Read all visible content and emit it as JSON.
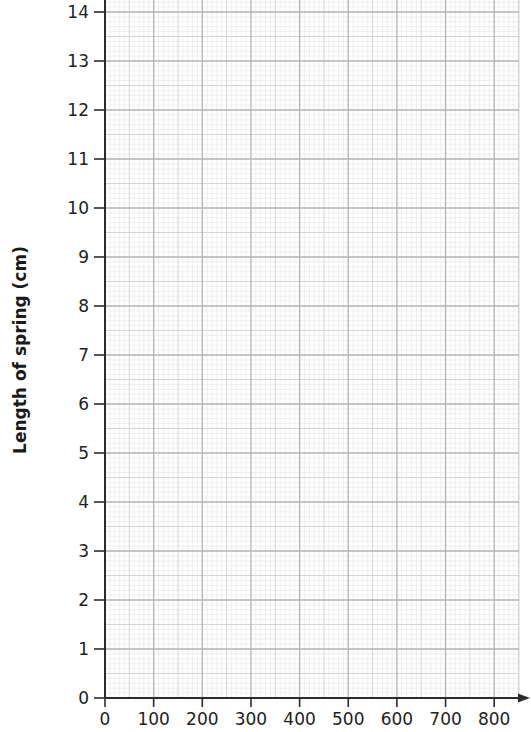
{
  "chart_data": {
    "type": "line",
    "title": "",
    "xlabel": "",
    "ylabel": "Length of spring (cm)",
    "x_ticks": [
      0,
      100,
      200,
      300,
      400,
      500,
      600,
      700,
      800
    ],
    "y_ticks": [
      0,
      1,
      2,
      3,
      4,
      5,
      6,
      7,
      8,
      9,
      10,
      11,
      12,
      13,
      14
    ],
    "xlim": [
      0,
      850
    ],
    "ylim": [
      0,
      14.25
    ],
    "grid": true,
    "grid_style": "graph paper: major every 100 (x) / 1 cm (y), medium every half, minor every tenth",
    "series": [],
    "legend": null
  },
  "colors": {
    "axis": "#2b2b2b",
    "major_grid": "#b3b3b3",
    "medium_grid": "#cfcfcf",
    "minor_grid": "#e4e4e4",
    "background": "#ffffff"
  },
  "layout": {
    "origin_x": 105,
    "origin_y": 698,
    "px_per_x_unit": 0.4865,
    "px_per_y_unit": 49,
    "grid_right": 519,
    "grid_top": 0,
    "arrow_end_x": 530
  }
}
